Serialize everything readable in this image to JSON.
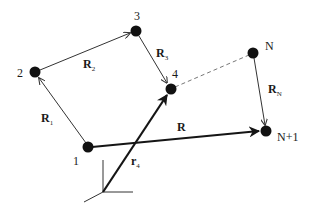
{
  "diagram": {
    "title": "",
    "colors": {
      "node": "#111111",
      "line": "#333333",
      "thick_line": "#151515",
      "dashed": "#777777",
      "background": "#ffffff"
    },
    "nodes": [
      {
        "id": "1",
        "label": "1",
        "x": 88,
        "y": 147
      },
      {
        "id": "2",
        "label": "2",
        "x": 35,
        "y": 72
      },
      {
        "id": "3",
        "label": "3",
        "x": 136,
        "y": 31
      },
      {
        "id": "4",
        "label": "4",
        "x": 171,
        "y": 89
      },
      {
        "id": "N",
        "label": "N",
        "x": 253,
        "y": 53
      },
      {
        "id": "N+1",
        "label": "N+1",
        "x": 266,
        "y": 131
      }
    ],
    "vectors": [
      {
        "id": "R1",
        "from": "1",
        "to": "2",
        "label": "R",
        "sub": "1",
        "style": "thin"
      },
      {
        "id": "R2",
        "from": "2",
        "to": "3",
        "label": "R",
        "sub": "2",
        "style": "thin"
      },
      {
        "id": "R3",
        "from": "3",
        "to": "4",
        "label": "R",
        "sub": "3",
        "style": "thin"
      },
      {
        "id": "RN",
        "from": "N",
        "to": "N+1",
        "label": "R",
        "sub": "N",
        "style": "thin"
      },
      {
        "id": "R",
        "from": "1",
        "to": "N+1",
        "label": "R",
        "sub": "",
        "style": "thick"
      },
      {
        "id": "r4",
        "from": "origin",
        "to": "4",
        "label": "r",
        "sub": "4",
        "style": "thick"
      }
    ],
    "dashed_links": [
      {
        "from": "4",
        "to": "N"
      }
    ],
    "origin_axes": {
      "x": 103,
      "y": 192
    }
  }
}
